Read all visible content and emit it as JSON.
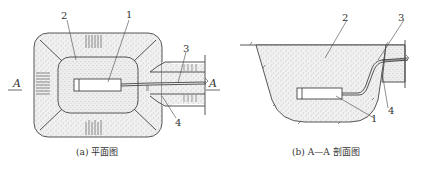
{
  "figure": {
    "type": "engineering-diagram",
    "colors": {
      "line": "#444444",
      "fill_soil": "#ededed",
      "fill_stipple": "#9a9a9a",
      "background": "#ffffff"
    }
  },
  "plan_view": {
    "caption": "(a) 平面图",
    "section_marker_left": "A",
    "section_marker_right": "A",
    "callouts": [
      {
        "id": "1",
        "label": "1"
      },
      {
        "id": "2",
        "label": "2"
      },
      {
        "id": "3",
        "label": "3"
      },
      {
        "id": "4",
        "label": "4"
      }
    ]
  },
  "section_view": {
    "caption": "(b) A—A 剖面图",
    "callouts": [
      {
        "id": "1",
        "label": "1"
      },
      {
        "id": "2",
        "label": "2"
      },
      {
        "id": "3",
        "label": "3"
      },
      {
        "id": "4",
        "label": "4"
      }
    ]
  }
}
